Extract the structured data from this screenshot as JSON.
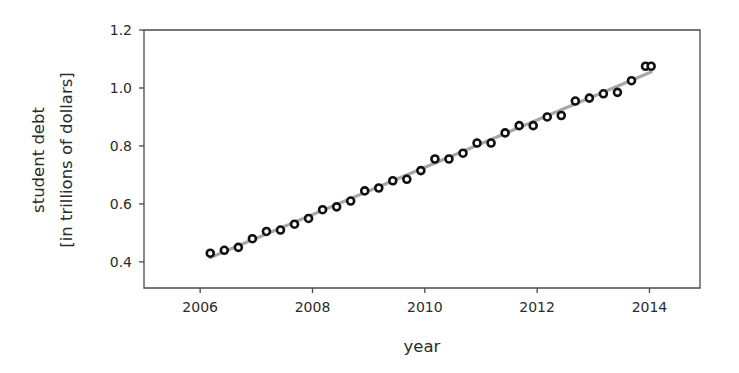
{
  "chart_data": {
    "type": "scatter",
    "title": "",
    "xlabel": "year",
    "ylabel": "student debt\n[in trillions of dollars]",
    "ylabel_line1": "student debt",
    "ylabel_line2": "[in trillions of dollars]",
    "xlim": [
      2005.0,
      2014.9
    ],
    "ylim": [
      0.31,
      1.2
    ],
    "xticks": [
      2006,
      2008,
      2010,
      2012,
      2014
    ],
    "xtick_labels": [
      "2006",
      "2008",
      "2010",
      "2012",
      "2014"
    ],
    "yticks": [
      0.4,
      0.6,
      0.8,
      1.0,
      1.2
    ],
    "ytick_labels": [
      "0.4",
      "0.6",
      "0.8",
      "1.0",
      "1.2"
    ],
    "grid": false,
    "legend": null,
    "marker_style": "open-circle",
    "trendline": {
      "name": "linear fit",
      "color": "#a8a8a8",
      "x": [
        2006.18,
        2014.03
      ],
      "y": [
        0.415,
        1.055
      ]
    },
    "series": [
      {
        "name": "student debt",
        "marker_color": "#111111",
        "x": [
          2006.18,
          2006.43,
          2006.68,
          2006.93,
          2007.18,
          2007.43,
          2007.68,
          2007.93,
          2008.18,
          2008.43,
          2008.68,
          2008.93,
          2009.18,
          2009.43,
          2009.68,
          2009.93,
          2010.18,
          2010.43,
          2010.68,
          2010.93,
          2011.18,
          2011.43,
          2011.68,
          2011.93,
          2012.18,
          2012.43,
          2012.68,
          2012.93,
          2013.18,
          2013.43,
          2013.68,
          2013.93,
          2014.03
        ],
        "y": [
          0.43,
          0.44,
          0.45,
          0.48,
          0.505,
          0.51,
          0.53,
          0.55,
          0.58,
          0.59,
          0.61,
          0.645,
          0.655,
          0.68,
          0.685,
          0.715,
          0.755,
          0.755,
          0.775,
          0.81,
          0.81,
          0.845,
          0.87,
          0.87,
          0.9,
          0.905,
          0.955,
          0.965,
          0.98,
          0.985,
          1.025,
          1.075,
          1.075
        ]
      }
    ]
  }
}
